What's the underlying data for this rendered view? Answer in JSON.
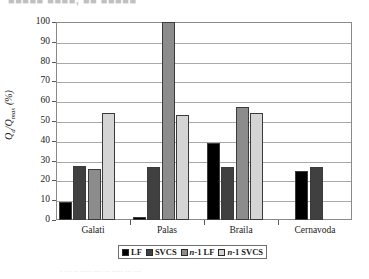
{
  "figure": {
    "top_artifact_text": "■■■■■ ■■■■, ■■ ■■■■■",
    "bottom_artifact_text": "· ··· ·· ····· ···· ·· ····· ··· ···"
  },
  "chart_data": {
    "type": "bar",
    "title": "",
    "xlabel": "",
    "ylabel": "Qd/Qmax (%)",
    "ylabel_parts": {
      "base1": "Q",
      "sub1": "d",
      "slash": "/",
      "base2": "Q",
      "sub2": "max",
      "unit": " (%)"
    },
    "categories": [
      "Galati",
      "Palas",
      "Braila",
      "Cernavoda"
    ],
    "series": [
      {
        "name": "LF",
        "color": "#000000",
        "values": [
          9,
          1.5,
          39,
          25
        ]
      },
      {
        "name": "SVCS",
        "color": "#404040",
        "values": [
          27.5,
          27,
          27,
          27
        ]
      },
      {
        "name": "n-1 LF",
        "color": "#8c8c8c",
        "values": [
          26,
          100,
          57,
          null
        ]
      },
      {
        "name": "n-1 SVCS",
        "color": "#d4d4d4",
        "values": [
          54,
          53,
          54,
          null
        ]
      }
    ],
    "legend_labels": [
      "LF",
      "SVCS",
      "n-1 LF",
      "n-1 SVCS"
    ],
    "legend_italic_prefix": [
      "",
      "",
      "n",
      "n"
    ],
    "legend_position": "bottom",
    "ylim": [
      0,
      100
    ],
    "yticks": [
      0,
      10,
      20,
      30,
      40,
      50,
      60,
      70,
      80,
      90,
      100
    ],
    "ytick_labels": [
      "0",
      "10",
      "20",
      "30",
      "40",
      "50",
      "60",
      "70",
      "80",
      "90",
      "100"
    ],
    "grid": true,
    "grid_axis": "y"
  }
}
